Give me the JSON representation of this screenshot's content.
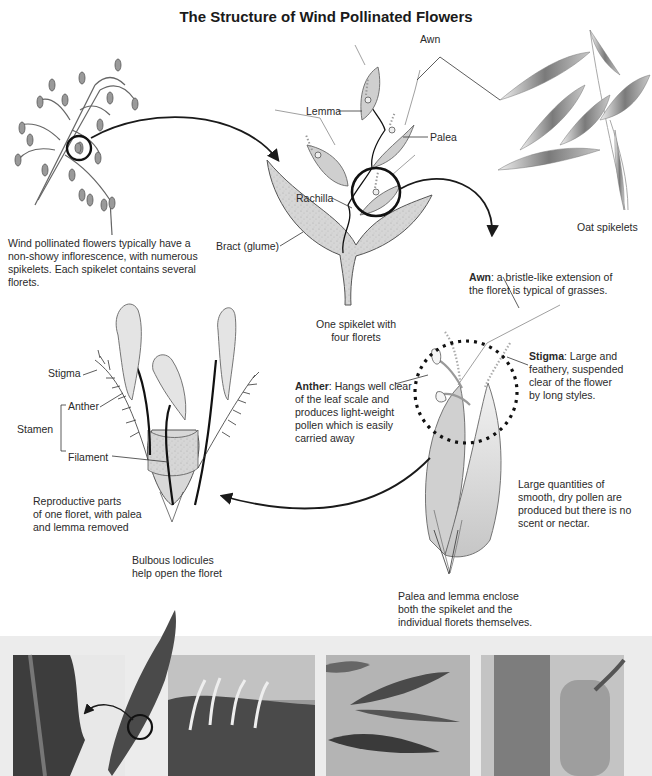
{
  "title": "The Structure of Wind Pollinated Flowers",
  "labels": {
    "awn": "Awn",
    "lemma": "Lemma",
    "palea": "Palea",
    "rachilla": "Rachilla",
    "bract": "Bract (glume)",
    "oat_spikelets": "Oat spikelets",
    "stigma": "Stigma",
    "anther": "Anther",
    "stamen": "Stamen",
    "filament": "Filament"
  },
  "captions": {
    "inflorescence": "Wind pollinated flowers typically have a non-showy inflorescence, with numerous spikelets. Each spikelet contains several florets.",
    "spikelet": [
      "One spikelet with",
      "four florets"
    ],
    "awn_term": "Awn",
    "awn_desc": ": a bristle-like extension of the floret is typical of grasses.",
    "stigma_term": "Stigma",
    "stigma_desc": ": Large and feathery, suspended clear of the flower by long styles.",
    "anther_term": "Anther",
    "anther_desc": ": Hangs well clear of the leaf scale and produces light-weight pollen which is easily carried away",
    "pollen": "Large quantities of smooth, dry pollen are produced but there is no scent or nectar.",
    "reproductive": [
      "Reproductive parts",
      "of one floret, with palea",
      "and lemma removed"
    ],
    "lodicules": [
      "Bulbous lodicules",
      "help open the floret"
    ],
    "palea_lemma": "Palea and lemma enclose both the spikelet and the individual florets themselves."
  },
  "photos": [
    {
      "subject": "grass-spike-closeup"
    },
    {
      "subject": "pampas-grass-in-wind"
    },
    {
      "subject": "oat-spikelet-closeup"
    },
    {
      "subject": "catkins"
    }
  ],
  "colors": {
    "ink": "#1a1a1a",
    "fill_light": "#dcdcdc",
    "fill_mid": "#c8c8c8",
    "strip_bg": "#ececec"
  }
}
